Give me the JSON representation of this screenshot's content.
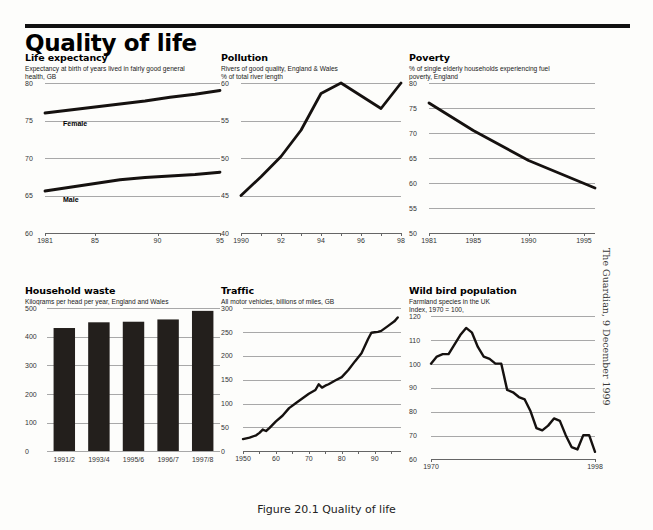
{
  "header": {
    "title": "Quality of life"
  },
  "caption": "Figure 20.1 Quality of life",
  "credit": "The Guardian, 9 December 1999",
  "panels": {
    "life_expectancy": {
      "title": "Life expectancy",
      "subtitle": "Expectancy at birth of years lived in fairly good general\nhealth, GB"
    },
    "pollution": {
      "title": "Pollution",
      "subtitle": "Rivers of good quality, England & Wales\n% of total river length"
    },
    "poverty": {
      "title": "Poverty",
      "subtitle": "% of single elderly households experiencing fuel\npoverty, England"
    },
    "household_waste": {
      "title": "Household waste",
      "subtitle": "Kilograms per head per year, England and Wales"
    },
    "traffic": {
      "title": "Traffic",
      "subtitle": "All motor vehicles, billions of miles, GB"
    },
    "wild_bird": {
      "title": "Wild bird population",
      "subtitle": "Farmland species in the UK\nIndex, 1970 = 100,"
    }
  },
  "chart_data": [
    {
      "id": "life_expectancy",
      "type": "line",
      "title": "Life expectancy",
      "subtitle": "Expectancy at birth of years lived in fairly good general health, GB",
      "xlabel": "",
      "ylabel": "",
      "xlim": [
        1981,
        1995
      ],
      "ylim": [
        60,
        80
      ],
      "yticks": [
        80,
        75,
        70,
        65,
        60
      ],
      "xticks": [
        1981,
        1985,
        1990,
        1995
      ],
      "xticklabels": [
        "1981",
        "85",
        "90",
        "95"
      ],
      "grid": true,
      "legend_position": "inline-labels",
      "series": [
        {
          "name": "Female",
          "x": [
            1981,
            1983,
            1985,
            1987,
            1989,
            1991,
            1993,
            1995
          ],
          "values": [
            76.0,
            76.4,
            76.8,
            77.2,
            77.6,
            78.1,
            78.5,
            79.0
          ]
        },
        {
          "name": "Male",
          "x": [
            1981,
            1983,
            1985,
            1987,
            1989,
            1991,
            1993,
            1995
          ],
          "values": [
            65.6,
            66.1,
            66.6,
            67.1,
            67.4,
            67.6,
            67.8,
            68.1
          ]
        }
      ]
    },
    {
      "id": "pollution",
      "type": "line",
      "title": "Pollution",
      "subtitle": "Rivers of good quality, England & Wales. % of total river length",
      "xlabel": "",
      "ylabel": "% of total river length",
      "xlim": [
        1990,
        1998
      ],
      "ylim": [
        40,
        60
      ],
      "yticks": [
        60,
        55,
        50,
        45,
        40
      ],
      "xticks": [
        1990,
        1992,
        1994,
        1996,
        1998
      ],
      "xticklabels": [
        "1990",
        "92",
        "94",
        "96",
        "98"
      ],
      "grid": true,
      "x": [
        1990,
        1991,
        1992,
        1993,
        1994,
        1995,
        1996,
        1997,
        1998
      ],
      "values": [
        45.0,
        47.5,
        50.2,
        53.7,
        58.6,
        60.0,
        58.3,
        56.6,
        60.0
      ]
    },
    {
      "id": "poverty",
      "type": "line",
      "title": "Poverty",
      "subtitle": "% of single elderly households experiencing fuel poverty, England",
      "xlabel": "",
      "ylabel": "",
      "xlim": [
        1981,
        1996
      ],
      "ylim": [
        50,
        80
      ],
      "yticks": [
        80,
        75,
        70,
        65,
        60,
        55,
        50
      ],
      "xticks": [
        1981,
        1985,
        1990,
        1995
      ],
      "xticklabels": [
        "1981",
        "1985",
        "1990",
        "1995"
      ],
      "grid": true,
      "x": [
        1981,
        1985,
        1990,
        1996
      ],
      "values": [
        76.0,
        70.5,
        64.5,
        59.0
      ]
    },
    {
      "id": "household_waste",
      "type": "bar",
      "title": "Household waste",
      "subtitle": "Kilograms per head per year, England and Wales",
      "xlabel": "",
      "ylabel": "",
      "ylim": [
        0,
        500
      ],
      "yticks": [
        500,
        400,
        300,
        200,
        100,
        0
      ],
      "categories": [
        "1991/2",
        "1993/4",
        "1995/6",
        "1996/7",
        "1997/8"
      ],
      "values": [
        430,
        450,
        452,
        460,
        490
      ],
      "grid": true
    },
    {
      "id": "traffic",
      "type": "line",
      "title": "Traffic",
      "subtitle": "All motor vehicles, billions of miles, GB",
      "xlabel": "",
      "ylabel": "billions of miles",
      "xlim": [
        1950,
        1998
      ],
      "ylim": [
        0,
        300
      ],
      "yticks": [
        300,
        250,
        200,
        150,
        100,
        50,
        0
      ],
      "xticks": [
        1950,
        1960,
        1970,
        1980,
        1990
      ],
      "xticklabels": [
        "1950",
        "60",
        "70",
        "80",
        "90"
      ],
      "grid": true,
      "x": [
        1950,
        1952,
        1954,
        1955,
        1956,
        1957,
        1958,
        1960,
        1962,
        1964,
        1966,
        1968,
        1970,
        1972,
        1973,
        1974,
        1975,
        1976,
        1978,
        1980,
        1982,
        1984,
        1986,
        1988,
        1989,
        1990,
        1991,
        1992,
        1994,
        1996,
        1997
      ],
      "values": [
        25,
        28,
        33,
        38,
        45,
        42,
        48,
        62,
        74,
        90,
        100,
        110,
        120,
        128,
        140,
        133,
        137,
        140,
        148,
        155,
        170,
        188,
        205,
        235,
        248,
        249,
        250,
        252,
        262,
        272,
        280
      ]
    },
    {
      "id": "wild_bird",
      "type": "line",
      "title": "Wild bird population",
      "subtitle": "Farmland species in the UK. Index, 1970 = 100,",
      "xlabel": "",
      "ylabel": "Index, 1970 = 100",
      "xlim": [
        1970,
        1998
      ],
      "ylim": [
        60,
        120
      ],
      "yticks": [
        120,
        110,
        100,
        90,
        80,
        70,
        60
      ],
      "xticks": [
        1970,
        1998
      ],
      "xticklabels": [
        "1970",
        "1998"
      ],
      "grid": true,
      "x": [
        1970,
        1971,
        1972,
        1973,
        1974,
        1975,
        1976,
        1977,
        1978,
        1979,
        1980,
        1981,
        1982,
        1983,
        1984,
        1985,
        1986,
        1987,
        1988,
        1989,
        1990,
        1991,
        1992,
        1993,
        1994,
        1995,
        1996,
        1997,
        1998
      ],
      "values": [
        100,
        103,
        104,
        104,
        108,
        112,
        115,
        113,
        107,
        103,
        102,
        100,
        100,
        89,
        88,
        86,
        85,
        80,
        73,
        72,
        74,
        77,
        76,
        70,
        65,
        64,
        70,
        70,
        63
      ]
    }
  ]
}
